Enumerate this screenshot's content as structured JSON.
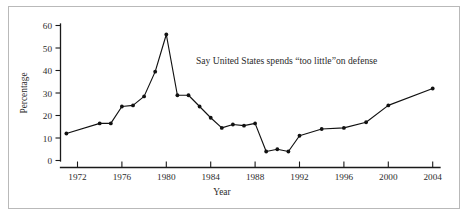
{
  "chart_data": {
    "type": "line",
    "title": "",
    "xlabel": "Year",
    "ylabel": "Percentage",
    "annotation": "Say United States spends “too little”on defense",
    "grid": false,
    "legend": "none",
    "xlim": [
      1970,
      2005
    ],
    "ylim": [
      0,
      60
    ],
    "yticks": [
      0,
      10,
      20,
      30,
      40,
      50,
      60
    ],
    "ytick_labels": [
      "0",
      "10",
      "20",
      "30",
      "40",
      "50",
      "60"
    ],
    "xticks": [
      1972,
      1976,
      1980,
      1984,
      1988,
      1992,
      1996,
      2000,
      2004
    ],
    "xtick_labels": [
      "1972",
      "1976",
      "1980",
      "1984",
      "1988",
      "1992",
      "1996",
      "2000",
      "2004"
    ],
    "marker": "filled-circle",
    "line_color": "#111111",
    "series": [
      {
        "name": "Say United States spends “too little” on defense",
        "x": [
          1971,
          1974,
          1975,
          1976,
          1977,
          1978,
          1979,
          1980,
          1981,
          1982,
          1983,
          1984,
          1985,
          1986,
          1987,
          1988,
          1989,
          1990,
          1991,
          1992,
          1994,
          1996,
          1998,
          2000,
          2004
        ],
        "values": [
          12,
          16.5,
          16.5,
          24,
          24.5,
          28.5,
          39.5,
          56,
          29,
          29,
          24,
          19,
          14.5,
          16,
          15.5,
          16.5,
          4,
          5,
          4,
          11,
          14,
          14.5,
          17,
          24.5,
          32
        ]
      }
    ]
  },
  "axes": {
    "y_title": "Percentage",
    "x_title": "Year"
  },
  "annotation": {
    "text": "Say United States spends “too little”on defense"
  },
  "colors": {
    "line": "#111111",
    "axis": "#1a1a1a",
    "text": "#2b2b2b",
    "frame": "#b9b9b9",
    "background": "#ffffff"
  }
}
